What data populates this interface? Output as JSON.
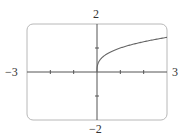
{
  "chart_data": {
    "type": "line",
    "title": "",
    "xlabel": "",
    "ylabel": "",
    "xlim": [
      -3,
      3
    ],
    "ylim": [
      -2,
      2
    ],
    "grid": false,
    "legend": null,
    "x_tick_labels": {
      "min": "−3",
      "max": "3"
    },
    "y_tick_labels": {
      "min": "−2",
      "max": "2"
    },
    "x_ticks": [
      -2,
      -1,
      1,
      2
    ],
    "y_ticks": [
      -1,
      1
    ],
    "series": [
      {
        "name": "y = x^(1/3), x ≥ 0",
        "x": [
          0,
          0.05,
          0.1,
          0.25,
          0.5,
          0.75,
          1,
          1.5,
          2,
          2.5,
          3
        ],
        "values": [
          0,
          0.37,
          0.46,
          0.63,
          0.79,
          0.91,
          1.0,
          1.14,
          1.26,
          1.36,
          1.44
        ]
      }
    ],
    "frame": "rounded-rectangle viewing window"
  },
  "colors": {
    "frame": "#b8b8b8",
    "axes": "#555555",
    "curve": "#666666",
    "text": "#333333"
  }
}
